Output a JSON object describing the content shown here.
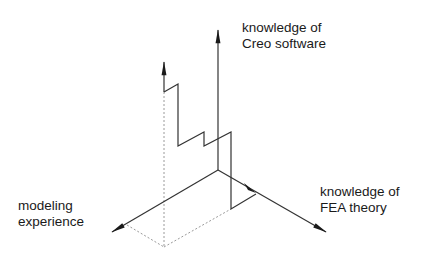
{
  "diagram": {
    "type": "3d-axes-learning-path",
    "colors": {
      "line": "#333333",
      "dashed": "#9a9a9a",
      "text": "#1a1a1a",
      "background": "#ffffff"
    },
    "axes": [
      {
        "id": "creo",
        "label_lines": [
          "knowledge of",
          "Creo software"
        ],
        "direction": "up"
      },
      {
        "id": "fea",
        "label_lines": [
          "knowledge of",
          "FEA theory"
        ],
        "direction": "down-right"
      },
      {
        "id": "modeling",
        "label_lines": [
          "modeling",
          "experience"
        ],
        "direction": "down-left"
      }
    ],
    "path": {
      "description": "zigzag learning path projected onto 3D axes",
      "style": "solid with arrowhead",
      "projections": "dashed"
    }
  }
}
